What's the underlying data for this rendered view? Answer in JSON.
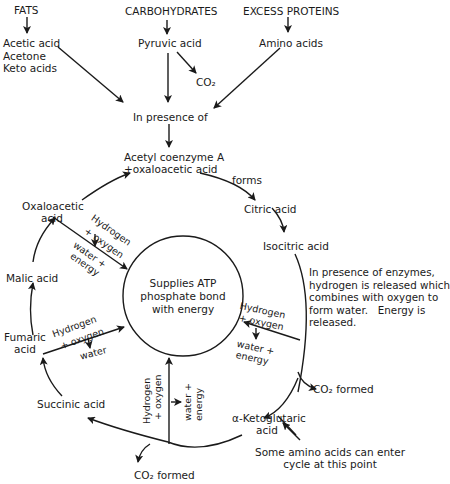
{
  "sources": {
    "fats": {
      "title": "FATS",
      "products": [
        "Acetic acid",
        "Acetone",
        "Keto acids"
      ]
    },
    "carbohydrates": {
      "title": "CARBOHYDRATES",
      "product": "Pyruvic acid",
      "byproduct": "CO₂"
    },
    "proteins": {
      "title": "EXCESS PROTEINS",
      "product": "Amino acids"
    }
  },
  "entry": {
    "condition": "In presence of",
    "compound_line1": "Acetyl coenzyme A",
    "compound_line2": "+oxaloacetic acid",
    "forms_label": "forms"
  },
  "cycle": {
    "citric": "Citric acid",
    "isocitric": "Isocitric acid",
    "ketoglutaric_line1": "α-Ketoglutaric",
    "ketoglutaric_line2": "acid",
    "succinic": "Succinic acid",
    "fumaric_line1": "Fumaric",
    "fumaric_line2": "acid",
    "malic": "Malic acid",
    "oxaloacetic_line1": "Oxaloacetic",
    "oxaloacetic_line2": "acid",
    "co2_right": "CO₂ formed",
    "co2_bottom": "CO₂ formed"
  },
  "center": {
    "line1": "Supplies ATP",
    "line2": "phosphate bond",
    "line3": "with energy"
  },
  "reactions": {
    "oxaloacetic": {
      "h": "Hydrogen",
      "o": "+ oxygen",
      "w1": "water +",
      "w2": "energy"
    },
    "fumaric": {
      "h": "Hydrogen",
      "o": "+ oxygen",
      "w1": "water"
    },
    "isocitric": {
      "h": "Hydrogen",
      "o": "+ oxygen",
      "w1": "water +",
      "w2": "energy"
    },
    "succinic": {
      "h": "Hydrogen",
      "o": "+ oxygen",
      "w1": "water +",
      "w2": "energy"
    }
  },
  "notes": {
    "enzymes": "In presence of enzymes,\nhydrogen is released which\ncombines with oxygen to\nform water.   Energy is\nreleased.",
    "amino_entry_line1": "Some amino acids can enter",
    "amino_entry_line2": "cycle at this point"
  }
}
